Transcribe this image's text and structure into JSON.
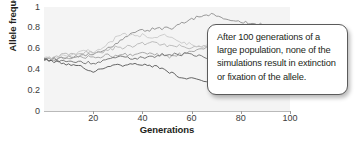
{
  "chart_data": {
    "type": "line",
    "title": "",
    "xlabel": "Generations",
    "ylabel": "Allele frequency",
    "xlim": [
      0,
      100
    ],
    "ylim": [
      0,
      1
    ],
    "grid": false,
    "legend": "none",
    "xticks": [
      "20",
      "40",
      "60",
      "80",
      "100"
    ],
    "xtick_values": [
      20,
      40,
      60,
      80,
      100
    ],
    "yticks": [
      "0",
      "0.2",
      "0.4",
      "0.6",
      "0.8",
      "1"
    ],
    "ytick_values": [
      0,
      0.2,
      0.4,
      0.6,
      0.8,
      1
    ],
    "start_value": 0.5,
    "annotations": [
      "After 100 generations of a large population, none of the simulations result in extinction or fixation of the allele."
    ],
    "series": [
      {
        "name": "simulation-1",
        "color": "#8c8c8c",
        "x": [
          0,
          2,
          4,
          6,
          8,
          10,
          12,
          14,
          16,
          18,
          20,
          22,
          24,
          26,
          28,
          30,
          32,
          34,
          36,
          38,
          40,
          42,
          44,
          46,
          48,
          50,
          52,
          54,
          56,
          58,
          60,
          62,
          64,
          66,
          68,
          70,
          72,
          74,
          76,
          78,
          80,
          82,
          84,
          86,
          88,
          90,
          92,
          94,
          96,
          98,
          100
        ],
        "values": [
          0.5,
          0.5,
          0.51,
          0.5,
          0.52,
          0.52,
          0.53,
          0.52,
          0.54,
          0.55,
          0.55,
          0.57,
          0.58,
          0.6,
          0.63,
          0.66,
          0.7,
          0.73,
          0.75,
          0.76,
          0.78,
          0.77,
          0.79,
          0.8,
          0.79,
          0.81,
          0.8,
          0.82,
          0.84,
          0.86,
          0.88,
          0.9,
          0.91,
          0.92,
          0.93,
          0.92,
          0.91,
          0.89,
          0.88,
          0.87,
          0.86,
          0.85,
          0.85,
          0.84,
          0.83,
          0.83,
          0.82,
          0.82,
          0.82,
          0.82,
          0.82
        ]
      },
      {
        "name": "simulation-2",
        "color": "#b5b5b5",
        "x": [
          0,
          2,
          4,
          6,
          8,
          10,
          12,
          14,
          16,
          18,
          20,
          22,
          24,
          26,
          28,
          30,
          32,
          34,
          36,
          38,
          40,
          42,
          44,
          46,
          48,
          50,
          52,
          54,
          56,
          58,
          60,
          62,
          64,
          66,
          68,
          70,
          72,
          74,
          76,
          78,
          80,
          82,
          84,
          86,
          88,
          90,
          92,
          94,
          96,
          98,
          100
        ],
        "values": [
          0.5,
          0.51,
          0.52,
          0.53,
          0.54,
          0.55,
          0.54,
          0.56,
          0.55,
          0.57,
          0.56,
          0.58,
          0.57,
          0.59,
          0.6,
          0.62,
          0.61,
          0.63,
          0.62,
          0.64,
          0.65,
          0.64,
          0.66,
          0.65,
          0.64,
          0.63,
          0.62,
          0.63,
          0.62,
          0.61,
          0.6,
          0.61,
          0.62,
          0.63,
          0.64,
          0.63,
          0.64,
          0.65,
          0.66,
          0.65,
          0.66,
          0.67,
          0.66,
          0.67,
          0.68,
          0.67,
          0.68,
          0.67,
          0.68,
          0.68,
          0.68
        ]
      },
      {
        "name": "simulation-3",
        "color": "#a0a0a0",
        "x": [
          0,
          2,
          4,
          6,
          8,
          10,
          12,
          14,
          16,
          18,
          20,
          22,
          24,
          26,
          28,
          30,
          32,
          34,
          36,
          38,
          40,
          42,
          44,
          46,
          48,
          50,
          52,
          54,
          56,
          58,
          60,
          62,
          64,
          66,
          68,
          70,
          72,
          74,
          76,
          78,
          80,
          82,
          84,
          86,
          88,
          90,
          92,
          94,
          96,
          98,
          100
        ],
        "values": [
          0.5,
          0.5,
          0.49,
          0.5,
          0.51,
          0.5,
          0.51,
          0.52,
          0.51,
          0.52,
          0.53,
          0.52,
          0.53,
          0.54,
          0.53,
          0.54,
          0.55,
          0.54,
          0.53,
          0.54,
          0.55,
          0.56,
          0.55,
          0.54,
          0.53,
          0.52,
          0.53,
          0.54,
          0.55,
          0.56,
          0.57,
          0.58,
          0.59,
          0.6,
          0.61,
          0.62,
          0.63,
          0.64,
          0.65,
          0.66,
          0.67,
          0.66,
          0.67,
          0.66,
          0.67,
          0.68,
          0.67,
          0.68,
          0.67,
          0.68,
          0.67
        ]
      },
      {
        "name": "simulation-4",
        "color": "#6e6e6e",
        "x": [
          0,
          2,
          4,
          6,
          8,
          10,
          12,
          14,
          16,
          18,
          20,
          22,
          24,
          26,
          28,
          30,
          32,
          34,
          36,
          38,
          40,
          42,
          44,
          46,
          48,
          50,
          52,
          54,
          56,
          58,
          60,
          62,
          64,
          66,
          68,
          70,
          72,
          74,
          76,
          78,
          80,
          82,
          84,
          86,
          88,
          90,
          92,
          94,
          96,
          98,
          100
        ],
        "values": [
          0.5,
          0.49,
          0.5,
          0.48,
          0.49,
          0.47,
          0.48,
          0.47,
          0.46,
          0.47,
          0.46,
          0.47,
          0.48,
          0.49,
          0.5,
          0.51,
          0.52,
          0.51,
          0.5,
          0.51,
          0.52,
          0.51,
          0.52,
          0.53,
          0.54,
          0.53,
          0.54,
          0.55,
          0.54,
          0.55,
          0.54,
          0.53,
          0.52,
          0.51,
          0.5,
          0.49,
          0.48,
          0.47,
          0.46,
          0.45,
          0.44,
          0.45,
          0.44,
          0.45,
          0.44,
          0.45,
          0.44,
          0.45,
          0.44,
          0.45,
          0.45
        ]
      },
      {
        "name": "simulation-5",
        "color": "#555555",
        "x": [
          0,
          2,
          4,
          6,
          8,
          10,
          12,
          14,
          16,
          18,
          20,
          22,
          24,
          26,
          28,
          30,
          32,
          34,
          36,
          38,
          40,
          42,
          44,
          46,
          48,
          50,
          52,
          54,
          56,
          58,
          60,
          62,
          64,
          66,
          68,
          70,
          72,
          74,
          76,
          78,
          80
        ],
        "values": [
          0.5,
          0.49,
          0.48,
          0.47,
          0.46,
          0.45,
          0.44,
          0.43,
          0.42,
          0.4,
          0.36,
          0.39,
          0.42,
          0.43,
          0.44,
          0.44,
          0.43,
          0.44,
          0.45,
          0.44,
          0.45,
          0.44,
          0.43,
          0.42,
          0.4,
          0.38,
          0.36,
          0.34,
          0.33,
          0.32,
          0.31,
          0.3,
          0.29,
          0.28,
          0.27,
          0.26,
          0.25,
          0.24,
          0.23,
          0.23,
          0.22
        ]
      },
      {
        "name": "simulation-6",
        "color": "#c8c8c8",
        "x": [
          0,
          2,
          4,
          6,
          8,
          10,
          12,
          14,
          16,
          18,
          20,
          22,
          24,
          26,
          28,
          30,
          32,
          34,
          36,
          38,
          40,
          42,
          44,
          46,
          48,
          50,
          52,
          54,
          56,
          58,
          60,
          62,
          64,
          66,
          68,
          70,
          72,
          74,
          76,
          78,
          80
        ],
        "values": [
          0.5,
          0.51,
          0.5,
          0.52,
          0.53,
          0.54,
          0.55,
          0.56,
          0.57,
          0.58,
          0.57,
          0.59,
          0.62,
          0.65,
          0.68,
          0.72,
          0.75,
          0.73,
          0.74,
          0.72,
          0.73,
          0.71,
          0.7,
          0.72,
          0.73,
          0.72,
          0.7,
          0.68,
          0.66,
          0.65,
          0.64,
          0.63,
          0.62,
          0.63,
          0.64,
          0.65,
          0.64,
          0.63,
          0.62,
          0.61,
          0.6
        ]
      }
    ]
  },
  "callout": {
    "text": "After 100 generations of a large population, none of the simulations result in extinction or fixation of the allele."
  },
  "colors": {
    "plot_background": "#f4f4f4",
    "axis": "#b9b9b9",
    "text": "#231f20",
    "callout_border": "#5b5b5b"
  }
}
